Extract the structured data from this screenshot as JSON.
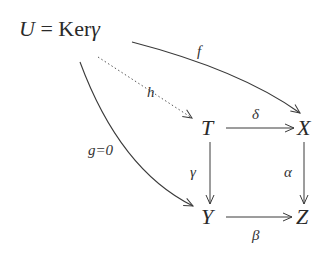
{
  "diagram": {
    "type": "commutative-diagram",
    "nodes": {
      "U": {
        "symbol": "U",
        "eq": "=",
        "ker": "Ker",
        "ker_arg": "γ"
      },
      "T": {
        "symbol": "T"
      },
      "X": {
        "symbol": "X"
      },
      "Y": {
        "symbol": "Y"
      },
      "Z": {
        "symbol": "Z"
      }
    },
    "edges": {
      "f": {
        "from": "U",
        "to": "X",
        "label": "f",
        "style": "solid-curved"
      },
      "h": {
        "from": "U",
        "to": "T",
        "label": "h",
        "style": "dotted"
      },
      "g": {
        "from": "U",
        "to": "Y",
        "label": "g=0",
        "style": "solid-curved"
      },
      "delta": {
        "from": "T",
        "to": "X",
        "label": "δ",
        "style": "solid"
      },
      "gamma": {
        "from": "T",
        "to": "Y",
        "label": "γ",
        "style": "solid"
      },
      "alpha": {
        "from": "X",
        "to": "Z",
        "label": "α",
        "style": "solid"
      },
      "beta": {
        "from": "Y",
        "to": "Z",
        "label": "β",
        "style": "solid"
      }
    },
    "colors": {
      "stroke": "#3a3a3a",
      "text": "#2a2a2a",
      "background": "#ffffff"
    }
  }
}
